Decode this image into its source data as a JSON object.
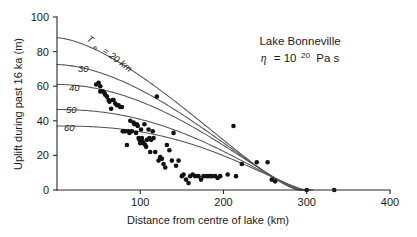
{
  "figure": {
    "background_color": "#ffffff",
    "axis_color": "#2b2b2b",
    "curve_color": "#555555",
    "point_color": "#111111"
  },
  "annotations": {
    "site_label": "Lake Bonneville",
    "viscosity_symbol": "η",
    "viscosity_equals": "= 10",
    "viscosity_exponent": "20",
    "viscosity_units": "Pa s"
  },
  "curve_labels": {
    "first_prefix": "T",
    "first_subscript": "e",
    "first_value": "= 20 km",
    "others": [
      "30",
      "40",
      "50",
      "60"
    ]
  },
  "chart_data": {
    "type": "scatter",
    "title": "",
    "subtitle": "",
    "xlabel": "Distance from centre of lake (km)",
    "ylabel": "Uplift during past 16 ka (m)",
    "xlim": [
      0,
      400
    ],
    "ylim": [
      0,
      100
    ],
    "xticks": [
      0,
      100,
      200,
      300,
      400
    ],
    "xtick_labels": [
      "0",
      "100",
      "200",
      "300",
      "400"
    ],
    "yticks": [
      0,
      20,
      40,
      60,
      80,
      100
    ],
    "ytick_labels": [
      "0",
      "20",
      "40",
      "60",
      "80",
      "100"
    ],
    "grid": false,
    "legend": "inline-curve-labels",
    "legend_position": "along-curves-upper-left",
    "annotation_text": [
      "Lake Bonneville",
      "η = 10²⁰ Pa s"
    ],
    "observed_points": {
      "name": "Observed uplift (shoreline data)",
      "marker": "filled-circle",
      "x": [
        47,
        50,
        52,
        52,
        55,
        57,
        58,
        60,
        62,
        63,
        65,
        67,
        68,
        70,
        72,
        74,
        76,
        78,
        79,
        80,
        82,
        84,
        86,
        87,
        88,
        90,
        92,
        93,
        95,
        96,
        97,
        98,
        99,
        100,
        101,
        102,
        103,
        104,
        105,
        106,
        107,
        108,
        110,
        111,
        112,
        113,
        115,
        116,
        118,
        120,
        122,
        124,
        126,
        128,
        130,
        132,
        135,
        138,
        140,
        143,
        146,
        150,
        152,
        155,
        158,
        160,
        163,
        166,
        170,
        173,
        176,
        180,
        183,
        186,
        190,
        193,
        196,
        205,
        212,
        215,
        222,
        240,
        253,
        258,
        262,
        300,
        333
      ],
      "y": [
        61,
        62,
        60,
        57,
        57,
        56,
        55,
        54,
        52,
        51,
        47,
        52,
        52,
        50,
        49,
        49,
        48,
        48,
        34,
        34,
        34,
        26,
        34,
        33,
        40,
        34,
        39,
        38,
        33,
        38,
        37,
        30,
        29,
        27,
        35,
        30,
        28,
        27,
        38,
        26,
        25,
        29,
        35,
        30,
        22,
        29,
        34,
        30,
        22,
        54,
        17,
        19,
        18,
        15,
        13,
        26,
        23,
        17,
        33,
        14,
        17,
        8,
        9,
        6,
        4,
        8,
        9,
        8,
        8,
        6,
        8,
        8,
        8,
        8,
        8,
        7,
        8,
        9,
        37,
        8,
        15,
        16,
        16,
        6,
        5,
        0,
        0
      ],
      "count": 87
    },
    "model_curves": {
      "name": "Flexural model predictions",
      "parameter_name": "Te",
      "parameter_units": "km",
      "parameter_label_prefix": "T_e =",
      "series": [
        {
          "name": "Te = 20 km",
          "label": "20",
          "y0": 88,
          "x_zero": 290,
          "shape_k": 1.55
        },
        {
          "name": "Te = 30 km",
          "label": "30",
          "y0": 72.5,
          "x_zero": 292,
          "shape_k": 1.75
        },
        {
          "name": "Te = 40 km",
          "label": "40",
          "y0": 61,
          "x_zero": 294,
          "shape_k": 1.95
        },
        {
          "name": "Te = 50 km",
          "label": "50",
          "y0": 46.5,
          "x_zero": 297,
          "shape_k": 2.2
        },
        {
          "name": "Te = 60 km",
          "label": "60",
          "y0": 37,
          "x_zero": 300,
          "shape_k": 2.45
        }
      ]
    }
  }
}
